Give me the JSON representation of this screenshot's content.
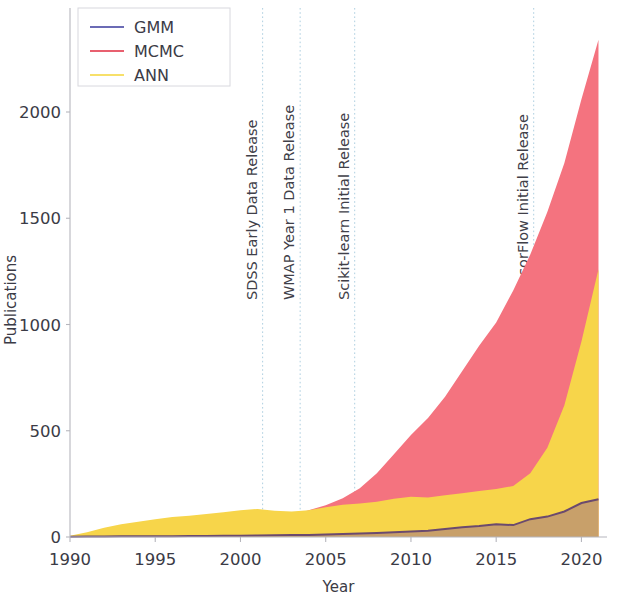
{
  "chart_data": {
    "type": "area",
    "title": "",
    "xlabel": "Year",
    "ylabel": "Publications",
    "xlim": [
      1990,
      2021.5
    ],
    "ylim": [
      -40,
      2420
    ],
    "xticks": [
      1990,
      1995,
      2000,
      2005,
      2010,
      2015,
      2020
    ],
    "yticks": [
      0,
      500,
      1000,
      1500,
      2000
    ],
    "xticklabels": [
      "1990",
      "1995",
      "2000",
      "2005",
      "2010",
      "2015",
      "2020"
    ],
    "yticklabels": [
      "0",
      "500",
      "1000",
      "1500",
      "2000"
    ],
    "grid": false,
    "stacked": false,
    "legend_position": "upper left",
    "x": [
      1990,
      1991,
      1992,
      1993,
      1994,
      1995,
      1996,
      1997,
      1998,
      1999,
      2000,
      2001,
      2002,
      2003,
      2004,
      2005,
      2006,
      2007,
      2008,
      2009,
      2010,
      2011,
      2012,
      2013,
      2014,
      2015,
      2016,
      2017,
      2018,
      2019,
      2020,
      2021
    ],
    "series": [
      {
        "name": "GMM",
        "color": "#6b6bb5",
        "fill_color": "#c8a06a",
        "values": [
          1,
          2,
          2,
          3,
          3,
          4,
          4,
          5,
          5,
          6,
          6,
          7,
          8,
          9,
          10,
          12,
          14,
          16,
          19,
          22,
          26,
          30,
          38,
          46,
          52,
          60,
          56,
          84,
          96,
          120,
          160,
          178
        ]
      },
      {
        "name": "MCMC",
        "color": "#e8606f",
        "fill_color": "#f4737f",
        "values": [
          2,
          3,
          4,
          5,
          7,
          9,
          12,
          16,
          20,
          26,
          34,
          44,
          70,
          102,
          126,
          150,
          182,
          230,
          300,
          390,
          480,
          560,
          660,
          780,
          900,
          1010,
          1160,
          1330,
          1530,
          1760,
          2060,
          2340
        ]
      },
      {
        "name": "ANN",
        "color": "#f7e06a",
        "fill_color": "#f7d54a",
        "values": [
          6,
          22,
          44,
          60,
          72,
          84,
          94,
          100,
          108,
          116,
          126,
          132,
          124,
          120,
          126,
          140,
          152,
          158,
          166,
          180,
          190,
          186,
          196,
          206,
          216,
          226,
          240,
          300,
          420,
          620,
          920,
          1260
        ]
      }
    ],
    "annotations": [
      {
        "label": "SDSS Early Data Release",
        "x": 2001.3
      },
      {
        "label": "WMAP Year 1 Data Release",
        "x": 2003.5
      },
      {
        "label": "Scikit-learn Initial Release",
        "x": 2006.7
      },
      {
        "label": "TensorFlow Initial Release",
        "x": 2017.2
      }
    ]
  },
  "legend": {
    "items": [
      {
        "label": "GMM",
        "color": "#6b6bb5"
      },
      {
        "label": "MCMC",
        "color": "#e8606f"
      },
      {
        "label": "ANN",
        "color": "#f7e06a"
      }
    ]
  }
}
